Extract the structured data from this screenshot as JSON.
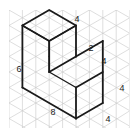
{
  "figure": {
    "grid": {
      "type": "triangular-isometric",
      "color": "#c8c8c8",
      "line_width": 0.6,
      "spacing_px": 15.5
    },
    "solid": {
      "outline_color": "#1a1a1a",
      "outline_width": 1.7,
      "interior_edge_color": "#1a1a1a",
      "interior_edge_width": 1.4,
      "shape": "L-shaped step prism"
    },
    "labels": [
      {
        "id": "left-height",
        "text": "6",
        "x": 19,
        "y": 72
      },
      {
        "id": "top-back-depth",
        "text": "4",
        "x": 77,
        "y": 22
      },
      {
        "id": "step-riser",
        "text": "2",
        "x": 91,
        "y": 51
      },
      {
        "id": "step-top-depth",
        "text": "4",
        "x": 104,
        "y": 64
      },
      {
        "id": "right-height",
        "text": "4",
        "x": 122,
        "y": 91
      },
      {
        "id": "bottom-right-depth",
        "text": "4",
        "x": 108,
        "y": 122
      },
      {
        "id": "bottom-front-width",
        "text": "8",
        "x": 53,
        "y": 115
      }
    ]
  }
}
